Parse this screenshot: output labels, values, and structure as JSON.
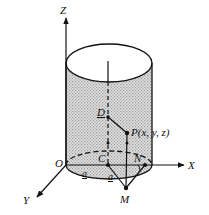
{
  "figure": {
    "type": "3d-cylinder-coordinate-diagram",
    "axes": {
      "z_label": "Z",
      "x_label": "X",
      "y_label": "Y",
      "origin_label": "O"
    },
    "points": {
      "center": "C",
      "top_point": "D",
      "point": "P(x, y, z)",
      "n_point": "N",
      "m_point": "M"
    },
    "lengths": {
      "oc": "a",
      "cm": "a"
    },
    "angle_label": "φ",
    "colors": {
      "stroke": "#111111",
      "fill_shaded": "#c9c9c9",
      "background": "#ffffff"
    }
  }
}
